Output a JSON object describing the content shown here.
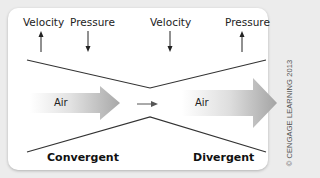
{
  "diagram": {
    "top_labels": [
      {
        "text": "Velocity",
        "direction": "up"
      },
      {
        "text": "Pressure",
        "direction": "down"
      },
      {
        "text": "Velocity",
        "direction": "down"
      },
      {
        "text": "Pressure",
        "direction": "up"
      }
    ],
    "air_labels": [
      "Air",
      "Air"
    ],
    "sections": {
      "left": "Convergent",
      "right": "Divergent"
    },
    "copyright": "© CENGAGE LEARNING 2013",
    "colors": {
      "background": "#ececec",
      "panel": "#ffffff",
      "line": "#333333",
      "arrow_dark": "#9a9a9a",
      "arrow_light": "#f4f4f4"
    }
  }
}
